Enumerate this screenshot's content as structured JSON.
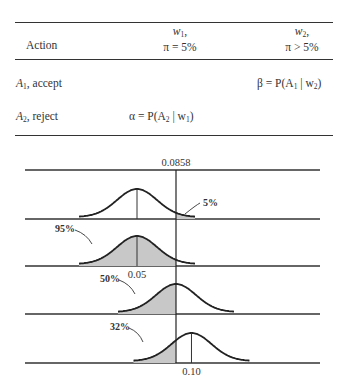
{
  "table": {
    "header": {
      "action": "Action",
      "col1_state": "w",
      "col1_state_sub": "1",
      "col1_cond": "π = 5%",
      "col2_state": "w",
      "col2_state_sub": "2",
      "col2_cond": "π > 5%"
    },
    "rows": [
      {
        "action_var": "A",
        "action_sub": "1",
        "action_label": ", accept",
        "col1": "",
        "col2_prefix": "β = P(A",
        "col2_sub1": "1",
        "col2_mid": " | w",
        "col2_sub2": "2",
        "col2_suffix": ")"
      },
      {
        "action_var": "A",
        "action_sub": "2",
        "action_label": ", reject",
        "col1_prefix": "α = P(A",
        "col1_sub1": "2",
        "col1_mid": " | w",
        "col1_sub2": "1",
        "col1_suffix": ")",
        "col2": ""
      }
    ]
  },
  "chart_data": {
    "type": "line",
    "title": "",
    "xlabel": "",
    "ylabel": "",
    "critical_value": 0.0858,
    "critical_value_label": "0.0858",
    "annotations": [
      "0.0858",
      "0.05",
      "0.10",
      "5%",
      "95%",
      "50%",
      "32%"
    ],
    "series": [
      {
        "name": "π = 0.05 (rejection tail)",
        "mean": 0.05,
        "mean_label": "",
        "shaded": "right of 0.0858",
        "shaded_pct": "5%",
        "show_mean_line": true
      },
      {
        "name": "π = 0.05 (acceptance)",
        "mean": 0.05,
        "mean_label": "0.05",
        "shaded": "left of 0.0858",
        "shaded_pct": "95%",
        "show_mean_line": true
      },
      {
        "name": "π = 0.0858",
        "mean": 0.0858,
        "mean_label": "",
        "shaded": "left of 0.0858",
        "shaded_pct": "50%",
        "show_mean_line": false
      },
      {
        "name": "π = 0.10",
        "mean": 0.1,
        "mean_label": "0.10",
        "shaded": "left of 0.0858",
        "shaded_pct": "32%",
        "show_mean_line": true
      }
    ],
    "legend": "none",
    "grid": false
  }
}
